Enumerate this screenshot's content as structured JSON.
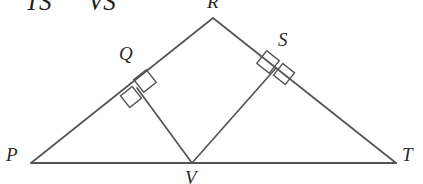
{
  "figure": {
    "kind": "geometry-diagram",
    "background_color": "#ffffff",
    "stroke_color": "#555555",
    "label_color": "#2b2b2b",
    "stroke_width": "1.6"
  },
  "cropped_header_text": {
    "fragment_1": "TS",
    "fragment_2": "VS"
  },
  "labels": {
    "P": "P",
    "T": "T",
    "V": "V",
    "R": "R",
    "Q": "Q",
    "S": "S"
  },
  "points": {
    "P": {
      "x": 31,
      "y": 163
    },
    "T": {
      "x": 396,
      "y": 163
    },
    "V": {
      "x": 192,
      "y": 163
    },
    "R": {
      "x": 213,
      "y": 18
    },
    "Q": {
      "x": 137,
      "y": 88
    },
    "S": {
      "x": 276,
      "y": 68
    }
  },
  "segments": [
    {
      "name": "PR",
      "from": "P",
      "to": "R"
    },
    {
      "name": "RT",
      "from": "R",
      "to": "T"
    },
    {
      "name": "PT",
      "from": "P",
      "to": "T"
    },
    {
      "name": "VQ",
      "from": "V",
      "to": "Q"
    },
    {
      "name": "VS",
      "from": "V",
      "to": "S"
    }
  ],
  "right_angle_marks": [
    {
      "at": "Q",
      "on_segment": "PR",
      "count": 2
    },
    {
      "at": "S",
      "on_segment": "RT",
      "count": 2
    }
  ]
}
